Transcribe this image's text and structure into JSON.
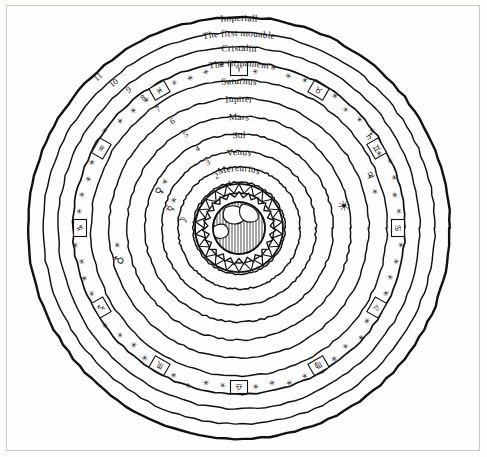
{
  "document": {
    "title": "Ptolemaic geocentric cosmos",
    "frame_color": "#c9c9c9",
    "ink_color": "#111111",
    "paper_color": "#fefefe"
  },
  "center": {
    "x": 239,
    "y": 228
  },
  "sphere_labels": [
    "Imperiall",
    "The first mouable",
    "Cristalin",
    "The firmament",
    "Saturnus",
    "Iupiter",
    "Mars",
    "Sol",
    "Venus",
    "Mercurius",
    "Luna"
  ],
  "ring_numbers": [
    "11",
    "10",
    "9",
    "8",
    "7",
    "6",
    "5",
    "4",
    "3",
    "2",
    "1"
  ],
  "ring_radii": [
    211,
    196,
    181,
    166,
    148,
    130,
    112,
    94,
    77,
    61,
    46
  ],
  "label_radii": [
    207,
    192,
    177,
    162,
    144,
    126,
    108,
    90,
    73,
    57,
    42
  ],
  "firmament_band": {
    "name": "firmament",
    "inner_radius": 152,
    "outer_radius": 166,
    "zodiac_symbols": [
      "♈",
      "♉",
      "♊",
      "♋",
      "♌",
      "♍",
      "♎",
      "♏",
      "♐",
      "♑",
      "♒",
      "♓"
    ],
    "star_glyph": "✳"
  },
  "planet_glyphs": [
    {
      "name": "saturn-glyph",
      "symbol": "♄",
      "ring": 4
    },
    {
      "name": "jupiter-glyph",
      "symbol": "♃",
      "ring": 5
    },
    {
      "name": "mars-glyph",
      "symbol": "♂",
      "ring": 6
    },
    {
      "name": "sol-glyph",
      "symbol": "☀",
      "ring": 7
    },
    {
      "name": "venus-glyph",
      "symbol": "♀",
      "ring": 8
    },
    {
      "name": "mercury-glyph",
      "symbol": "☿",
      "ring": 9
    },
    {
      "name": "luna-glyph",
      "symbol": "☽",
      "ring": 10
    }
  ],
  "earth": {
    "name": "earth-globe",
    "globe_radius": 26,
    "flame_radius": 33,
    "element_band_outer": 44,
    "element_band_inner": 35,
    "teeth": 22,
    "sea_hatching": true,
    "land_visible": true
  }
}
